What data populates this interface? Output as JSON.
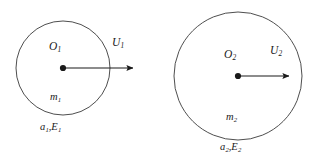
{
  "figure": {
    "type": "physics-diagram",
    "background_color": "#ffffff",
    "stroke_color": "#3a3a3a",
    "text_color": "#1a1a1a"
  },
  "objects": [
    {
      "id": "particle-1",
      "circle": {
        "cx": 63,
        "cy": 68,
        "r": 47
      },
      "center_dot": {
        "cx": 63,
        "cy": 68,
        "r": 3.1
      },
      "arrow": {
        "x1": 63,
        "y1": 68,
        "x2": 136,
        "y2": 68
      },
      "labels": {
        "center": {
          "text": "O",
          "sub": "1",
          "x": 50,
          "y": 48
        },
        "velocity": {
          "text": "U",
          "sub": "1",
          "x": 112,
          "y": 44
        },
        "mass": {
          "text": "m",
          "sub": "1",
          "x": 50,
          "y": 98
        },
        "properties": {
          "text_a": "a",
          "sub_a": "1",
          "separator": ",",
          "text_e": "E",
          "sub_e": "1",
          "x": 40,
          "y": 128
        }
      }
    },
    {
      "id": "particle-2",
      "circle": {
        "cx": 238,
        "cy": 76,
        "r": 64
      },
      "center_dot": {
        "cx": 238,
        "cy": 76,
        "r": 3.1
      },
      "arrow": {
        "x1": 238,
        "y1": 76,
        "x2": 292,
        "y2": 76
      },
      "labels": {
        "center": {
          "text": "O",
          "sub": "2",
          "x": 224,
          "y": 56
        },
        "velocity": {
          "text": "U",
          "sub": "2",
          "x": 270,
          "y": 52
        },
        "mass": {
          "text": "m",
          "sub": "2",
          "x": 226,
          "y": 118
        },
        "properties": {
          "text_a": "a",
          "sub_a": "2",
          "separator": ",",
          "text_e": "E",
          "sub_e": "2",
          "x": 220,
          "y": 148
        }
      }
    }
  ],
  "text": {
    "p1_center": "O",
    "p1_center_sub": "1",
    "p1_velocity": "U",
    "p1_velocity_sub": "1",
    "p1_mass": "m",
    "p1_mass_sub": "1",
    "p1_prop_a": "a",
    "p1_prop_a_sub": "1",
    "p1_prop_sep": ",",
    "p1_prop_e": "E",
    "p1_prop_e_sub": "1",
    "p2_center": "O",
    "p2_center_sub": "2",
    "p2_velocity": "U",
    "p2_velocity_sub": "2",
    "p2_mass": "m",
    "p2_mass_sub": "2",
    "p2_prop_a": "a",
    "p2_prop_a_sub": "2",
    "p2_prop_sep": ",",
    "p2_prop_e": "E",
    "p2_prop_e_sub": "2"
  }
}
